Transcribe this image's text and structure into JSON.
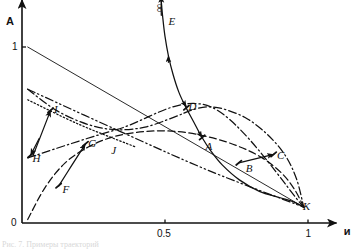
{
  "figure": {
    "type": "scientific-line-plot",
    "background": "#ffffff",
    "ink_color": "#111111",
    "caption_fragment": "Рис. 7. Примеры траекторий"
  },
  "axes": {
    "x_label": "и",
    "y_label": "А",
    "infinity_label": "∞",
    "origin_label": "0",
    "x_ticks": [
      {
        "value": 0.5,
        "label": "0.5"
      },
      {
        "value": 1.0,
        "label": "1"
      }
    ],
    "y_ticks": [
      {
        "value": 1.0,
        "label": "1"
      }
    ],
    "xlim": [
      0,
      1.12
    ],
    "ylim": [
      0,
      1.3
    ]
  },
  "point_labels": [
    {
      "id": "A",
      "label": "A",
      "x": 0.635,
      "y": 0.435
    },
    {
      "id": "B",
      "label": "B",
      "x": 0.775,
      "y": 0.315
    },
    {
      "id": "C",
      "label": "C",
      "x": 0.885,
      "y": 0.385
    },
    {
      "id": "D",
      "label": "D",
      "x": 0.575,
      "y": 0.665
    },
    {
      "id": "E",
      "label": "E",
      "x": 0.505,
      "y": 1.145
    },
    {
      "id": "F",
      "label": "F",
      "x": 0.135,
      "y": 0.195
    },
    {
      "id": "G",
      "label": "G",
      "x": 0.225,
      "y": 0.455
    },
    {
      "id": "H",
      "label": "H",
      "x": 0.03,
      "y": 0.37
    },
    {
      "id": "I",
      "label": "I",
      "x": 0.105,
      "y": 0.65
    },
    {
      "id": "J",
      "label": "J",
      "x": 0.305,
      "y": 0.415
    },
    {
      "id": "K",
      "label": "K",
      "x": 0.975,
      "y": 0.095
    }
  ],
  "chart_data": {
    "type": "line",
    "title": "",
    "xlabel": "и",
    "ylabel": "А",
    "xlim": [
      0,
      1.12
    ],
    "ylim": [
      0,
      1.3
    ],
    "grid": false,
    "legend": "none",
    "annotations": [
      "∞",
      "0",
      "0.5",
      "1",
      "1"
    ],
    "series": [
      {
        "name": "curve-E-D-K-solid",
        "style": "solid",
        "points": [
          [
            0.487,
            1.26
          ],
          [
            0.492,
            1.17
          ],
          [
            0.5,
            1.06
          ],
          [
            0.512,
            0.95
          ],
          [
            0.528,
            0.845
          ],
          [
            0.548,
            0.745
          ],
          [
            0.572,
            0.66
          ],
          [
            0.6,
            0.575
          ],
          [
            0.628,
            0.49
          ],
          [
            0.66,
            0.41
          ],
          [
            0.7,
            0.33
          ],
          [
            0.76,
            0.245
          ],
          [
            0.83,
            0.18
          ],
          [
            0.9,
            0.145
          ],
          [
            0.95,
            0.12
          ],
          [
            0.985,
            0.09
          ]
        ],
        "arrows": [
          {
            "at": [
              0.512,
              0.95
            ],
            "dir": "up"
          },
          {
            "at": [
              0.575,
              0.66
            ],
            "dir": "down-right"
          },
          {
            "at": [
              0.63,
              0.486
            ],
            "dir": "down-right"
          }
        ]
      },
      {
        "name": "curve-top-dashdot",
        "style": "dash-dot",
        "points": [
          [
            0.02,
            0.76
          ],
          [
            0.12,
            0.64
          ],
          [
            0.23,
            0.56
          ],
          [
            0.33,
            0.53
          ],
          [
            0.43,
            0.545
          ],
          [
            0.53,
            0.6
          ],
          [
            0.6,
            0.645
          ],
          [
            0.66,
            0.66
          ],
          [
            0.72,
            0.64
          ],
          [
            0.79,
            0.59
          ],
          [
            0.86,
            0.5
          ],
          [
            0.92,
            0.385
          ],
          [
            0.96,
            0.25
          ],
          [
            0.985,
            0.09
          ]
        ],
        "arrows": []
      },
      {
        "name": "curve-mid-dashed",
        "style": "dashed",
        "points": [
          [
            0.02,
            0.02
          ],
          [
            0.08,
            0.2
          ],
          [
            0.15,
            0.34
          ],
          [
            0.23,
            0.43
          ],
          [
            0.32,
            0.49
          ],
          [
            0.43,
            0.52
          ],
          [
            0.54,
            0.52
          ],
          [
            0.65,
            0.49
          ],
          [
            0.75,
            0.44
          ],
          [
            0.84,
            0.37
          ],
          [
            0.91,
            0.28
          ],
          [
            0.955,
            0.185
          ],
          [
            0.985,
            0.09
          ]
        ],
        "arrows": []
      },
      {
        "name": "line-1-to-K-solid",
        "style": "solid-thin",
        "points": [
          [
            0.02,
            1.0
          ],
          [
            0.985,
            0.09
          ]
        ],
        "arrows": []
      },
      {
        "name": "line-dashdotdot-lower",
        "style": "dash-dot-dot",
        "points": [
          [
            0.02,
            0.76
          ],
          [
            0.33,
            0.53
          ],
          [
            0.65,
            0.3
          ],
          [
            0.985,
            0.09
          ]
        ],
        "arrows": []
      },
      {
        "name": "line-H-to-K-dashdot",
        "style": "dash-dot",
        "points": [
          [
            0.02,
            0.37
          ],
          [
            0.33,
            0.53
          ],
          [
            0.66,
            0.66
          ],
          [
            0.985,
            0.09
          ]
        ],
        "arrows": []
      },
      {
        "name": "line-I-dotted",
        "style": "dotted",
        "points": [
          [
            0.02,
            0.7
          ],
          [
            0.2,
            0.56
          ],
          [
            0.4,
            0.43
          ]
        ],
        "arrows": []
      },
      {
        "name": "arrow-H-up",
        "style": "solid-arrow",
        "points": [
          [
            0.038,
            0.38
          ],
          [
            0.1,
            0.64
          ]
        ],
        "arrows": [
          {
            "at": [
              0.1,
              0.64
            ],
            "dir": "up-right"
          }
        ]
      },
      {
        "name": "arrow-H-down",
        "style": "solid-arrow",
        "points": [
          [
            0.06,
            0.48
          ],
          [
            0.03,
            0.385
          ]
        ],
        "arrows": [
          {
            "at": [
              0.03,
              0.385
            ],
            "dir": "down-left"
          }
        ]
      },
      {
        "name": "arrow-F-to-G",
        "style": "solid-arrow",
        "points": [
          [
            0.128,
            0.21
          ],
          [
            0.175,
            0.33
          ],
          [
            0.222,
            0.45
          ]
        ],
        "arrows": [
          {
            "at": [
              0.222,
              0.45
            ],
            "dir": "up-right"
          }
        ]
      },
      {
        "name": "arrow-B-to-C",
        "style": "solid-arrow",
        "points": [
          [
            0.758,
            0.342
          ],
          [
            0.88,
            0.39
          ]
        ],
        "arrows": [
          {
            "at": [
              0.82,
              0.365
            ],
            "dir": "right"
          },
          {
            "at": [
              0.88,
              0.39
            ],
            "dir": "right"
          }
        ]
      },
      {
        "name": "infinity-arrow",
        "style": "solid-arrow",
        "points": [
          [
            0.487,
            1.18
          ],
          [
            0.487,
            1.29
          ]
        ],
        "arrows": [
          {
            "at": [
              0.487,
              1.295
            ],
            "dir": "up"
          }
        ]
      }
    ],
    "markers": [
      {
        "label": "A",
        "x": 0.63,
        "y": 0.486
      },
      {
        "label": "B",
        "x": 0.758,
        "y": 0.342
      },
      {
        "label": "C",
        "x": 0.88,
        "y": 0.39
      },
      {
        "label": "D",
        "x": 0.575,
        "y": 0.655
      },
      {
        "label": "F",
        "x": 0.128,
        "y": 0.212
      },
      {
        "label": "G",
        "x": 0.222,
        "y": 0.45
      },
      {
        "label": "H",
        "x": 0.03,
        "y": 0.385
      },
      {
        "label": "I",
        "x": 0.1,
        "y": 0.64
      }
    ]
  }
}
